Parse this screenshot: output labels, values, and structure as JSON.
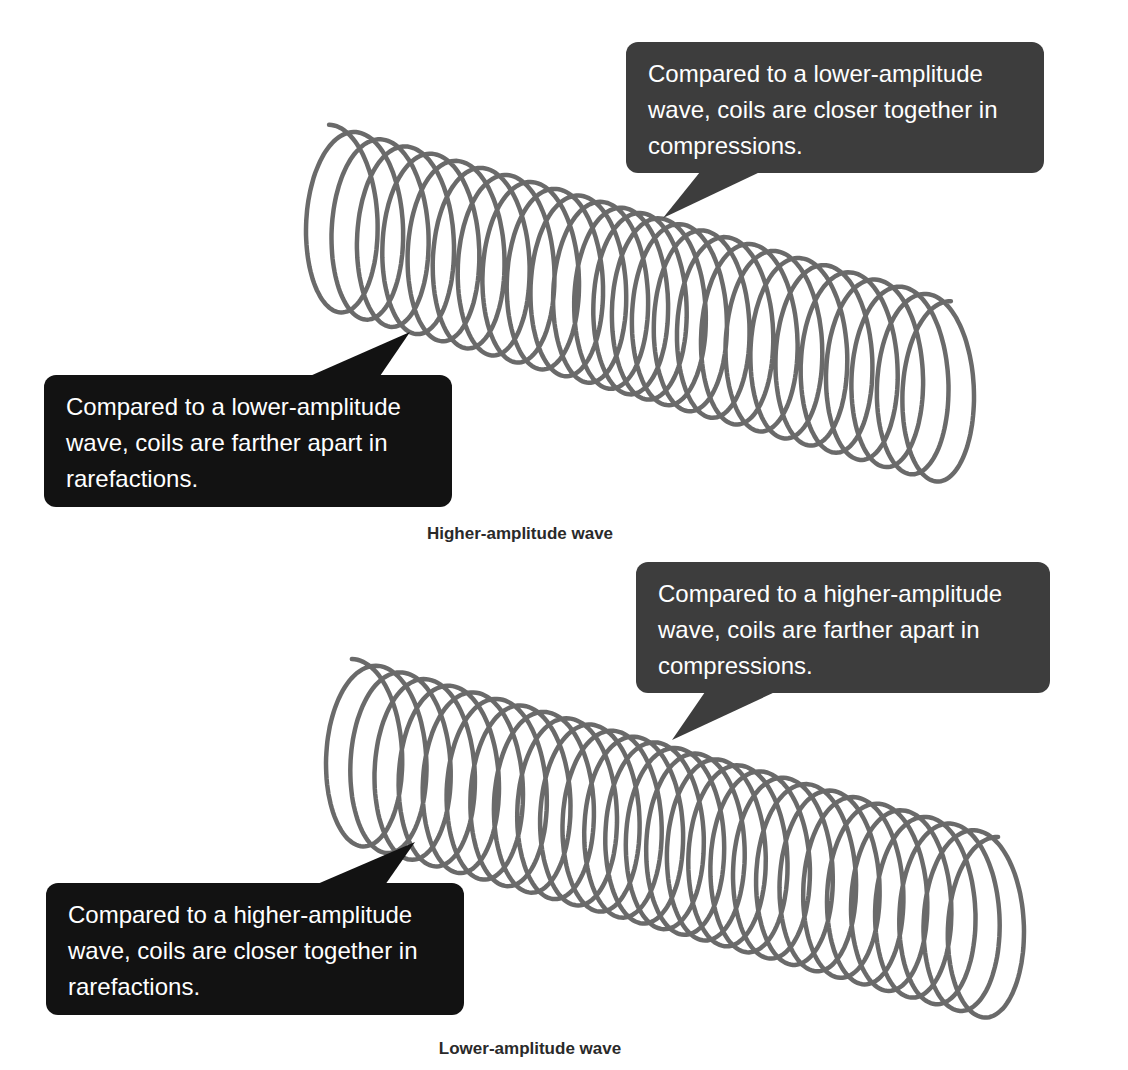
{
  "colors": {
    "coil": "#6a6a6a",
    "bubble_dark_gray": "#3d3d3d",
    "bubble_black": "#121212",
    "bubble_text": "#ffffff",
    "caption": "#2a2a2a",
    "background": "#ffffff"
  },
  "panels": [
    {
      "caption": "Higher-amplitude wave",
      "compression_callout": "Compared to a lower-amplitude wave, coils are closer together in compressions.",
      "rarefaction_callout": "Compared to a lower-amplitude wave, coils are farther apart in rarefactions."
    },
    {
      "caption": "Lower-amplitude wave",
      "compression_callout": "Compared to a higher-amplitude wave, coils are farther apart in compressions.",
      "rarefaction_callout": "Compared to a higher-amplitude wave, coils are closer together in rarefactions."
    }
  ]
}
